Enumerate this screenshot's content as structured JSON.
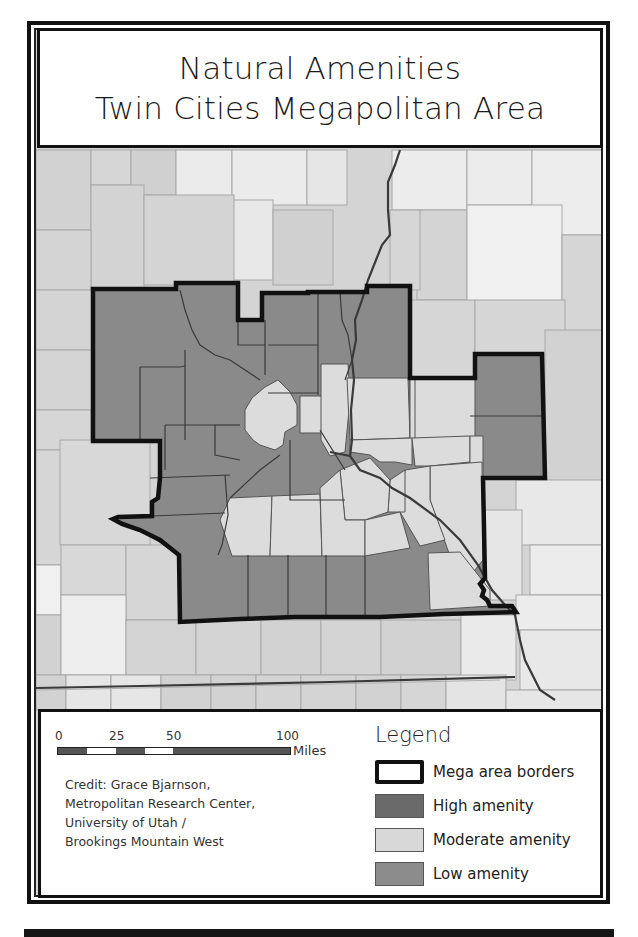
{
  "title": {
    "line1": "Natural Amenities",
    "line2": "Twin Cities Megapolitan Area"
  },
  "scale_bar": {
    "ticks": [
      "0",
      "25",
      "50",
      "100"
    ],
    "unit": "Miles"
  },
  "credit": {
    "lines": [
      "Credit: Grace Bjarnson,",
      "Metropolitan Research Center,",
      "University of Utah /",
      "Brookings Mountain West"
    ]
  },
  "legend": {
    "title": "Legend",
    "items": [
      {
        "label": "Mega area borders",
        "swatch": "#ffffff",
        "type": "border"
      },
      {
        "label": "High amenity",
        "swatch": "#6a6a6a",
        "type": "fill"
      },
      {
        "label": "Moderate amenity",
        "swatch": "#d8d8d8",
        "type": "fill"
      },
      {
        "label": "Low amenity",
        "swatch": "#8c8c8c",
        "type": "fill"
      }
    ]
  },
  "colors": {
    "mega_region_fill": "#8a8a8a",
    "moderate_fill": "#dcdcdc",
    "outside_light": "#e9e9e9",
    "outside_mid": "#d2d2d2",
    "border": "#111111",
    "county_line": "#9a9a9a",
    "river": "#3a3a3a"
  }
}
